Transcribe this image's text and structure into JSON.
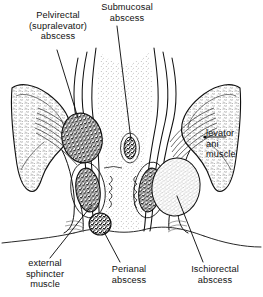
{
  "figure": {
    "background_color": "#ffffff",
    "ink_color": "#111111"
  },
  "labels": {
    "pelvirectal": "Pelvirectal\n(supralevator)\nabscess",
    "submucosal": "Submucosal\nabscess",
    "levator": "levator\nani\nmuscle",
    "external_sphincter": "external\nsphincter\nmuscle",
    "perianal": "Perianal\nabscess",
    "ischiorectal": "Ischiorectal\nabscess"
  }
}
